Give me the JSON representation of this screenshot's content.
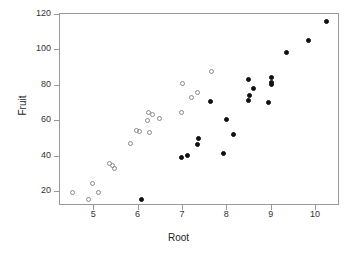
{
  "chart_data": {
    "type": "scatter",
    "title": "",
    "xlabel": "Root",
    "ylabel": "Fruit",
    "xlim": [
      4.23,
      10.54
    ],
    "ylim": [
      12.1,
      120.6
    ],
    "xticks": [
      5,
      6,
      7,
      8,
      9,
      10
    ],
    "yticks": [
      20,
      40,
      60,
      80,
      100,
      120
    ],
    "grid": false,
    "legend": "none",
    "series": [
      {
        "name": "open",
        "marker": "open-circle",
        "color": "#8a8a8a",
        "points": [
          [
            4.53,
            19.1
          ],
          [
            4.9,
            15.2
          ],
          [
            4.99,
            24.3
          ],
          [
            5.11,
            19.4
          ],
          [
            5.37,
            35.6
          ],
          [
            5.43,
            34.5
          ],
          [
            5.48,
            33.0
          ],
          [
            5.85,
            46.6
          ],
          [
            5.97,
            54.4
          ],
          [
            6.05,
            53.5
          ],
          [
            6.22,
            59.6
          ],
          [
            6.25,
            64.4
          ],
          [
            6.27,
            53.0
          ],
          [
            6.33,
            63.2
          ],
          [
            6.5,
            61.1
          ],
          [
            6.98,
            64.3
          ],
          [
            7.21,
            73.1
          ],
          [
            7.34,
            75.4
          ],
          [
            7.02,
            80.6
          ],
          [
            7.66,
            87.3
          ]
        ]
      },
      {
        "name": "filled",
        "marker": "filled-circle",
        "color": "#111111",
        "points": [
          [
            6.1,
            15.0
          ],
          [
            6.99,
            38.7
          ],
          [
            7.12,
            39.9
          ],
          [
            7.35,
            46.5
          ],
          [
            7.38,
            49.8
          ],
          [
            7.65,
            70.7
          ],
          [
            7.93,
            41.3
          ],
          [
            8.01,
            60.6
          ],
          [
            8.17,
            52.2
          ],
          [
            8.5,
            82.8
          ],
          [
            8.51,
            71.2
          ],
          [
            8.52,
            73.8
          ],
          [
            8.62,
            78.0
          ],
          [
            8.95,
            70.0
          ],
          [
            9.02,
            84.2
          ],
          [
            9.02,
            81.5
          ],
          [
            9.02,
            80.2
          ],
          [
            9.35,
            98.3
          ],
          [
            9.85,
            104.8
          ],
          [
            10.26,
            115.8
          ]
        ]
      }
    ]
  }
}
